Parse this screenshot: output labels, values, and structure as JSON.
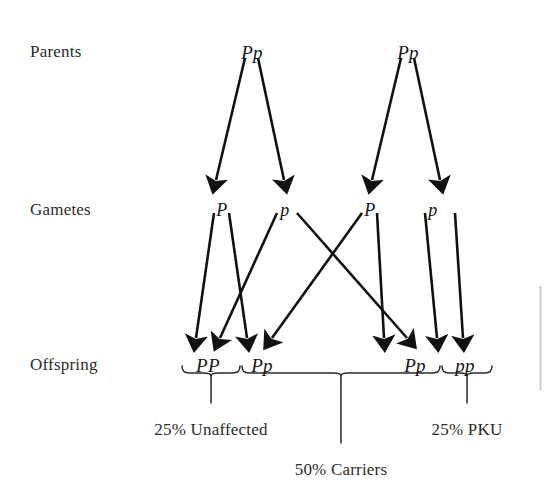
{
  "diagram": {
    "background_color": "#ffffff",
    "stroke_color": "#111111",
    "rows": [
      {
        "key": "parents",
        "label": "Parents",
        "x": 30,
        "y": 42
      },
      {
        "key": "gametes",
        "label": "Gametes",
        "x": 30,
        "y": 200
      },
      {
        "key": "offspring",
        "label": "Offspring",
        "x": 30,
        "y": 355
      }
    ],
    "parents": [
      {
        "id": "parent-1",
        "genotype": "Pp",
        "x": 252,
        "y": 42
      },
      {
        "id": "parent-2",
        "genotype": "Pp",
        "x": 408,
        "y": 42
      }
    ],
    "gametes": [
      {
        "id": "gamete-1",
        "allele": "P",
        "x": 222,
        "y": 200
      },
      {
        "id": "gamete-2",
        "allele": "p",
        "x": 285,
        "y": 200
      },
      {
        "id": "gamete-3",
        "allele": "P",
        "x": 370,
        "y": 200
      },
      {
        "id": "gamete-4",
        "allele": "p",
        "x": 433,
        "y": 200
      }
    ],
    "offspring": [
      {
        "id": "offspring-1",
        "genotype": "PP",
        "x": 208,
        "y": 355
      },
      {
        "id": "offspring-2",
        "genotype": "Pp",
        "x": 262,
        "y": 355
      },
      {
        "id": "offspring-3",
        "genotype": "Pp",
        "x": 415,
        "y": 355
      },
      {
        "id": "offspring-4",
        "genotype": "pp",
        "x": 465,
        "y": 355
      }
    ],
    "outcomes": [
      {
        "id": "outcome-unaffected",
        "label": "25% Unaffected",
        "percent": "25%",
        "phenotype": "Unaffected",
        "x": 211,
        "y": 420
      },
      {
        "id": "outcome-pku",
        "label": "25% PKU",
        "percent": "25%",
        "phenotype": "PKU",
        "x": 467,
        "y": 420
      },
      {
        "id": "outcome-carriers",
        "label": "50% Carriers",
        "percent": "50%",
        "phenotype": "Carriers",
        "x": 341,
        "y": 460
      }
    ],
    "braces": [
      {
        "id": "brace-unaffected",
        "left": 182,
        "right": 240,
        "top": 366,
        "stem_x": 211,
        "stem_bottom": 403
      },
      {
        "id": "brace-carriers",
        "left": 242,
        "right": 440,
        "top": 366,
        "stem_x": 341,
        "stem_bottom": 443
      },
      {
        "id": "brace-pku",
        "left": 442,
        "right": 492,
        "top": 366,
        "stem_x": 467,
        "stem_bottom": 403
      }
    ],
    "arrows_parents_to_gametes": [
      {
        "id": "arrow-p1-to-g1",
        "from": "parent-1",
        "to": "gamete-1",
        "x1": 245,
        "y1": 58,
        "x2": 216,
        "y2": 180
      },
      {
        "id": "arrow-p1-to-g2",
        "from": "parent-1",
        "to": "gamete-2",
        "x1": 258,
        "y1": 58,
        "x2": 284,
        "y2": 180
      },
      {
        "id": "arrow-p2-to-g3",
        "from": "parent-2",
        "to": "gamete-3",
        "x1": 401,
        "y1": 58,
        "x2": 372,
        "y2": 180
      },
      {
        "id": "arrow-p2-to-g4",
        "from": "parent-2",
        "to": "gamete-4",
        "x1": 414,
        "y1": 58,
        "x2": 440,
        "y2": 180
      }
    ],
    "arrows_gametes_to_offspring": [
      {
        "id": "arrow-g1-to-o1",
        "from": "gamete-1",
        "to": "offspring-1",
        "x1": 214,
        "y1": 213,
        "x2": 196,
        "y2": 338
      },
      {
        "id": "arrow-g1-to-o2",
        "from": "gamete-1",
        "to": "offspring-2",
        "x1": 229,
        "y1": 213,
        "x2": 247,
        "y2": 338
      },
      {
        "id": "arrow-g2-to-o2",
        "from": "gamete-2",
        "to": "offspring-2",
        "x1": 277,
        "y1": 213,
        "x2": 220,
        "y2": 338
      },
      {
        "id": "arrow-g2-to-o3",
        "from": "gamete-2",
        "to": "offspring-3",
        "x1": 297,
        "y1": 213,
        "x2": 407,
        "y2": 338
      },
      {
        "id": "arrow-g3-to-o2",
        "from": "gamete-3",
        "to": "offspring-2",
        "x1": 362,
        "y1": 213,
        "x2": 272,
        "y2": 338
      },
      {
        "id": "arrow-g3-to-o3",
        "from": "gamete-3",
        "to": "offspring-3",
        "x1": 377,
        "y1": 213,
        "x2": 384,
        "y2": 338
      },
      {
        "id": "arrow-g4-to-o3",
        "from": "gamete-4",
        "to": "offspring-3",
        "x1": 425,
        "y1": 213,
        "x2": 437,
        "y2": 338
      },
      {
        "id": "arrow-g4-to-o4",
        "from": "gamete-4",
        "to": "offspring-4",
        "x1": 455,
        "y1": 213,
        "x2": 463,
        "y2": 338
      }
    ]
  }
}
